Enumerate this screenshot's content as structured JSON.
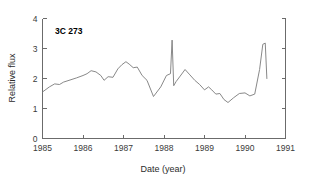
{
  "chart_data": {
    "type": "line",
    "title": "",
    "annotation": "3C 273",
    "xlabel": "Date (year)",
    "ylabel": "Relative flux",
    "xlim": [
      1985,
      1991
    ],
    "ylim": [
      0,
      4
    ],
    "xticks": [
      1985,
      1986,
      1987,
      1988,
      1989,
      1990,
      1991
    ],
    "xtick_labels": [
      "1985",
      "1986",
      "1987",
      "1988",
      "1989",
      "1990",
      "1991"
    ],
    "yticks": [
      0,
      1,
      2,
      3,
      4
    ],
    "ytick_labels": [
      "0",
      "1",
      "2",
      "3",
      "4"
    ],
    "grid": false,
    "legend": false,
    "line_color": "#7a7a7a",
    "axis_color": "#6b6b6b",
    "series": [
      {
        "name": "3C 273 relative flux",
        "x": [
          1985.0,
          1985.17,
          1985.3,
          1985.42,
          1985.52,
          1985.68,
          1985.84,
          1986.0,
          1986.1,
          1986.2,
          1986.32,
          1986.44,
          1986.52,
          1986.62,
          1986.74,
          1986.86,
          1986.96,
          1987.06,
          1987.14,
          1987.24,
          1987.34,
          1987.46,
          1987.58,
          1987.74,
          1987.92,
          1988.06,
          1988.16,
          1988.2,
          1988.24,
          1988.3,
          1988.4,
          1988.52,
          1988.64,
          1988.76,
          1988.88,
          1989.0,
          1989.1,
          1989.18,
          1989.28,
          1989.38,
          1989.48,
          1989.58,
          1989.72,
          1989.86,
          1990.0,
          1990.12,
          1990.24,
          1990.36,
          1990.44,
          1990.5,
          1990.54
        ],
        "y": [
          1.55,
          1.72,
          1.82,
          1.8,
          1.88,
          1.95,
          2.02,
          2.1,
          2.16,
          2.26,
          2.22,
          2.1,
          1.94,
          2.06,
          2.04,
          2.32,
          2.46,
          2.56,
          2.48,
          2.36,
          2.38,
          2.1,
          1.94,
          1.4,
          1.72,
          2.1,
          2.16,
          3.28,
          1.76,
          1.9,
          2.08,
          2.3,
          2.12,
          1.94,
          1.8,
          1.62,
          1.72,
          1.62,
          1.48,
          1.5,
          1.3,
          1.2,
          1.36,
          1.5,
          1.52,
          1.42,
          1.48,
          2.3,
          3.14,
          3.18,
          2.0
        ]
      }
    ]
  }
}
